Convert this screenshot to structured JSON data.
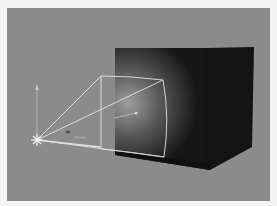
{
  "viewport": {
    "label": "3D viewport - spotlight illuminating cube",
    "background": "#8b8b8b",
    "frame_color": "#f4f4f4"
  },
  "scene": {
    "objects": [
      {
        "name": "spot-light",
        "icon": "light-burst-icon",
        "position": [
          37,
          140
        ]
      },
      {
        "name": "light-cone-gizmo",
        "color": "#e6e6e6"
      },
      {
        "name": "cube",
        "color": "#151515",
        "highlight": "#9a9a9a"
      }
    ],
    "gizmo": {
      "up_axis_color": "#b8b8b8",
      "forward_axis_color": "#dcdcdc"
    }
  }
}
